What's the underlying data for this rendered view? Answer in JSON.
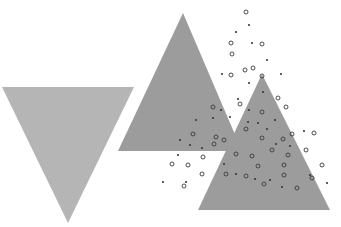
{
  "illustration": {
    "background": "#ffffff",
    "shapes": [
      {
        "name": "inverted-triangle-left",
        "points": "2,87 134,87 68,223",
        "fill": "#b5b5b5"
      },
      {
        "name": "triangle-middle",
        "points": "183,13 118,151 242,151",
        "fill": "#9c9c9c"
      },
      {
        "name": "triangle-right",
        "points": "262,74 198,210 330,210",
        "fill": "#9c9c9c"
      }
    ],
    "dots": {
      "ring_color": "#3a3a3a",
      "fill_color": "#3a3a3a",
      "rings": [
        [
          246,
          12
        ],
        [
          231,
          43
        ],
        [
          262,
          44
        ],
        [
          232,
          54
        ],
        [
          245,
          70
        ],
        [
          253,
          68
        ],
        [
          231,
          75
        ],
        [
          262,
          76
        ],
        [
          262,
          112
        ],
        [
          213,
          107
        ],
        [
          240,
          104
        ],
        [
          278,
          98
        ],
        [
          286,
          107
        ],
        [
          292,
          134
        ],
        [
          193,
          134
        ],
        [
          283,
          139
        ],
        [
          246,
          129
        ],
        [
          262,
          138
        ],
        [
          214,
          144
        ],
        [
          258,
          166
        ],
        [
          216,
          137
        ],
        [
          252,
          156
        ],
        [
          288,
          155
        ],
        [
          246,
          176
        ],
        [
          226,
          174
        ],
        [
          284,
          165
        ],
        [
          284,
          175
        ],
        [
          322,
          165
        ],
        [
          312,
          178
        ],
        [
          297,
          188
        ],
        [
          188,
          165
        ],
        [
          203,
          157
        ],
        [
          172,
          164
        ],
        [
          184,
          186
        ],
        [
          202,
          174
        ],
        [
          236,
          154
        ],
        [
          264,
          184
        ],
        [
          314,
          133
        ],
        [
          224,
          140
        ],
        [
          272,
          150
        ],
        [
          306,
          150
        ]
      ],
      "filled": [
        [
          249,
          25
        ],
        [
          236,
          32
        ],
        [
          252,
          43
        ],
        [
          267,
          60
        ],
        [
          222,
          74
        ],
        [
          281,
          74
        ],
        [
          238,
          99
        ],
        [
          249,
          83
        ],
        [
          230,
          117
        ],
        [
          248,
          122
        ],
        [
          258,
          123
        ],
        [
          267,
          129
        ],
        [
          290,
          146
        ],
        [
          276,
          144
        ],
        [
          202,
          148
        ],
        [
          178,
          155
        ],
        [
          190,
          145
        ],
        [
          224,
          164
        ],
        [
          186,
          182
        ],
        [
          163,
          182
        ],
        [
          236,
          174
        ],
        [
          255,
          179
        ],
        [
          270,
          180
        ],
        [
          282,
          187
        ],
        [
          213,
          118
        ],
        [
          263,
          92
        ],
        [
          304,
          131
        ],
        [
          249,
          110
        ],
        [
          221,
          110
        ],
        [
          310,
          175
        ],
        [
          327,
          183
        ],
        [
          180,
          140
        ],
        [
          196,
          120
        ],
        [
          275,
          120
        ]
      ]
    }
  }
}
